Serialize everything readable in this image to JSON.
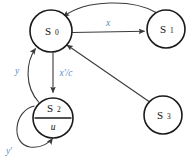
{
  "diagram": {
    "type": "state-transition-diagram",
    "background_color": "#ffffff",
    "node_stroke_color": "#1a1a1a",
    "edge_stroke_color": "#3a3a3a",
    "label_color": "#5a8ac8",
    "states": [
      {
        "id": "S0",
        "name": "S",
        "subscript": "0",
        "output": "",
        "cx": 51,
        "cy": 31,
        "r": 21,
        "divided": false
      },
      {
        "id": "S1",
        "name": "S",
        "subscript": "1",
        "output": "",
        "cx": 166,
        "cy": 29,
        "r": 19,
        "divided": false
      },
      {
        "id": "S2",
        "name": "S",
        "subscript": "2",
        "output": "u",
        "cx": 53,
        "cy": 118,
        "r": 20,
        "divided": true
      },
      {
        "id": "S3",
        "name": "S",
        "subscript": "3",
        "output": "",
        "cx": 163,
        "cy": 115,
        "r": 19,
        "divided": false
      }
    ],
    "transitions": [
      {
        "id": "t-s0-s1",
        "from": "S0",
        "to": "S1",
        "label": "x",
        "label_x": 108,
        "label_y": 24
      },
      {
        "id": "t-s1-s0",
        "from": "S1",
        "to": "S0",
        "label": "",
        "label_x": 0,
        "label_y": 0
      },
      {
        "id": "t-s0-s2",
        "from": "S0",
        "to": "S2",
        "label": "x'/c",
        "label_x": 66,
        "label_y": 74
      },
      {
        "id": "t-s2-s0",
        "from": "S2",
        "to": "S0",
        "label": "y",
        "label_x": 17,
        "label_y": 72
      },
      {
        "id": "t-s2-s2",
        "from": "S2",
        "to": "S2",
        "label": "y'",
        "label_x": 9,
        "label_y": 152
      },
      {
        "id": "t-s3-s0",
        "from": "S3",
        "to": "S0",
        "label": "",
        "label_x": 0,
        "label_y": 0
      }
    ]
  }
}
